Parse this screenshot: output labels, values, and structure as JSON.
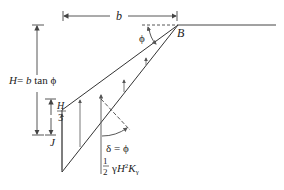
{
  "diagram": {
    "type": "retaining-wall-earth-pressure",
    "labels": {
      "b": "b",
      "B": "B",
      "phi_top": "ϕ",
      "H_eq_H": "H",
      "H_eq_rest": " = b tan ϕ",
      "H3_num": "H",
      "H3_den": "3",
      "J": "J",
      "delta": "δ = ϕ",
      "force_frac_num": "1",
      "force_frac_den": "2",
      "force_rest": "γH²K",
      "force_sub": "γ"
    },
    "colors": {
      "line": "#333333",
      "arrow": "#555555",
      "text": "#222222",
      "background": "#ffffff"
    }
  }
}
